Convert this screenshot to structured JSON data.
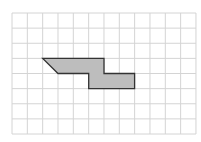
{
  "diagram": {
    "type": "grid-polygon",
    "grid": {
      "columns": 12,
      "rows": 8,
      "origin_px": [
        12,
        13
      ],
      "cell_w": 15.33,
      "cell_h": 15.125,
      "line_color": "#d4d4d4"
    },
    "shape": {
      "vertices_grid": [
        [
          2,
          3
        ],
        [
          6,
          3
        ],
        [
          6,
          4
        ],
        [
          8,
          4
        ],
        [
          8,
          5
        ],
        [
          5,
          5
        ],
        [
          5,
          4
        ],
        [
          3,
          4
        ]
      ],
      "fill": "#bdbdbd",
      "stroke": "#333333"
    }
  }
}
